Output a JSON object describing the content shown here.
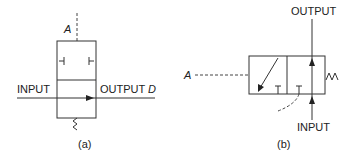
{
  "diagram_a": {
    "caption": "(a)",
    "label_signal": "A",
    "label_input": "INPUT",
    "label_output": "OUTPUT",
    "label_output_var": "D"
  },
  "diagram_b": {
    "caption": "(b)",
    "label_signal": "A",
    "label_input": "INPUT",
    "label_output": "OUTPUT"
  }
}
